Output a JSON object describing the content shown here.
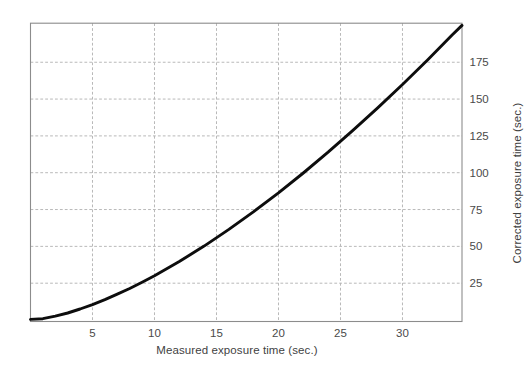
{
  "chart_data": {
    "type": "line",
    "title": "",
    "xlabel": "Measured exposure time (sec.)",
    "ylabel": "Corrected exposure time (sec.)",
    "ylabel_side": "right",
    "x_ticks": [
      5,
      10,
      15,
      20,
      25,
      30
    ],
    "y_ticks": [
      25,
      50,
      75,
      100,
      125,
      150,
      175
    ],
    "xlim": [
      0,
      34.8
    ],
    "ylim": [
      -1,
      201.5
    ],
    "grid": "dashed",
    "legend": "none",
    "series": [
      {
        "name": "reciprocity-correction-curve",
        "points": [
          [
            0,
            0.4
          ],
          [
            1,
            0.9
          ],
          [
            2,
            2.6
          ],
          [
            3,
            4.8
          ],
          [
            4,
            7.5
          ],
          [
            5,
            10.5
          ],
          [
            6,
            13.8
          ],
          [
            7,
            17.5
          ],
          [
            8,
            21.4
          ],
          [
            9,
            25.7
          ],
          [
            10,
            30.1
          ],
          [
            12,
            39.7
          ],
          [
            14,
            50.2
          ],
          [
            16,
            61.5
          ],
          [
            18,
            73.6
          ],
          [
            20,
            86.3
          ],
          [
            22,
            99.8
          ],
          [
            24,
            113.9
          ],
          [
            26,
            128.7
          ],
          [
            28,
            144.0
          ],
          [
            30,
            159.9
          ],
          [
            32,
            176.4
          ],
          [
            34,
            193.5
          ],
          [
            34.8,
            200.0
          ]
        ]
      }
    ],
    "colors": {
      "curve": "#0d0d0d",
      "grid": "#b9b9b9",
      "frame": "#8c8c8c",
      "tick_label": "#4a4a4a",
      "axis_label": "#3f3f3f",
      "background": "#ffffff"
    }
  }
}
